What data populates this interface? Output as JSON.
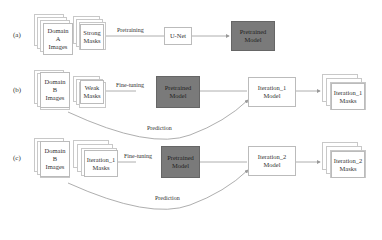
{
  "rows": [
    {
      "label": "(a)",
      "input_stack": "Domain\nA\nImages",
      "mask_stack": "Strong\nMasks",
      "edge_label": "Pretraining",
      "unet": "U-Net",
      "output_model": "Pretrained\nModel"
    },
    {
      "label": "(b)",
      "input_stack": "Domain\nB\nImages",
      "mask_stack": "Weak\nMasks",
      "edge_label": "Fine-tuning",
      "model": "Pretrained\nModel",
      "iteration_model": "Iteration_1\nModel",
      "output_stack": "Iteration_1\nMasks",
      "prediction_label": "Prediction"
    },
    {
      "label": "(c)",
      "input_stack": "Domain\nB\nImages",
      "mask_stack": "Iteration_1\nMasks",
      "edge_label": "Fine-tuning",
      "model": "Pretrained\nModel",
      "iteration_model": "Iteration_2\nModel",
      "output_stack": "Iteration_2\nMasks",
      "prediction_label": "Prediction"
    }
  ],
  "colors": {
    "model_fill": "#7a7a7a",
    "line": "#999999",
    "border": "#bbbbbb"
  }
}
